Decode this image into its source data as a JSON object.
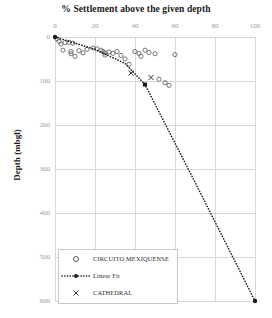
{
  "chart_data": {
    "type": "scatter",
    "title": "% Settlement above the given depth",
    "xlabel": "",
    "ylabel": "Depth (mbgl)",
    "xlim": [
      0,
      100
    ],
    "ylim": [
      0,
      600
    ],
    "y_inverted": true,
    "grid": true,
    "x_axis_position": "top",
    "xticks": [
      0,
      20,
      40,
      60,
      80,
      100
    ],
    "yticks": [
      0,
      100,
      200,
      300,
      400,
      500,
      600
    ],
    "legend_position": "bottom-left",
    "series": [
      {
        "name": "CIRCUITO MEXIQUENSE",
        "marker": "open-circle",
        "color": "#555555",
        "points": [
          [
            1,
            4
          ],
          [
            2,
            10
          ],
          [
            3,
            16
          ],
          [
            5,
            13
          ],
          [
            7,
            12
          ],
          [
            9,
            14
          ],
          [
            4,
            30
          ],
          [
            8,
            33
          ],
          [
            8,
            38
          ],
          [
            10,
            44
          ],
          [
            12,
            31
          ],
          [
            14,
            36
          ],
          [
            16,
            28
          ],
          [
            19,
            25
          ],
          [
            21,
            27
          ],
          [
            23,
            30
          ],
          [
            24,
            33
          ],
          [
            25,
            36
          ],
          [
            25,
            41
          ],
          [
            27,
            34
          ],
          [
            29,
            37
          ],
          [
            31,
            33
          ],
          [
            33,
            42
          ],
          [
            35,
            50
          ],
          [
            37,
            62
          ],
          [
            40,
            33
          ],
          [
            42,
            37
          ],
          [
            43,
            44
          ],
          [
            45,
            30
          ],
          [
            47,
            35
          ],
          [
            50,
            38
          ],
          [
            52,
            96
          ],
          [
            55,
            104
          ],
          [
            57,
            110
          ],
          [
            60,
            40
          ]
        ]
      },
      {
        "name": "CATHEDRAL",
        "marker": "x",
        "color": "#333333",
        "points": [
          [
            38,
            82
          ],
          [
            48,
            92
          ]
        ]
      },
      {
        "name": "Linear Fit",
        "marker": "dotted-line",
        "color": "#1a1a1a",
        "points": [
          [
            0,
            0
          ],
          [
            20,
            28
          ],
          [
            35,
            60
          ],
          [
            45,
            108
          ],
          [
            70,
            330
          ],
          [
            100,
            600
          ]
        ]
      }
    ]
  },
  "legend": {
    "items": [
      {
        "label": "CIRCUITO MEXIQUENSE",
        "marker": "open-circle"
      },
      {
        "label": "Linear Fit",
        "marker": "dotted-line"
      },
      {
        "label": "CATHEDRAL",
        "marker": "x"
      }
    ]
  },
  "axes": {
    "x_tick_labels": [
      "0",
      "20",
      "40",
      "60",
      "80",
      "100"
    ],
    "y_tick_labels": [
      "0",
      "100",
      "200",
      "300",
      "400",
      "500",
      "600"
    ],
    "y_axis_title": "Depth (mbgl)"
  }
}
